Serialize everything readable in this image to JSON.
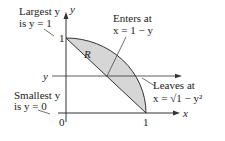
{
  "diagram": {
    "region_label": "R",
    "axes": {
      "x_label": "x",
      "y_label": "y",
      "origin_label": "0",
      "x_tick_label": "1",
      "y_tick_label": "1"
    },
    "horizontal_line_label": "y",
    "annotations": {
      "largest_line1": "Largest y",
      "largest_line2": "is y = 1",
      "smallest_line1": "Smallest y",
      "smallest_line2": "is y = 0",
      "enters_line1": "Enters at",
      "enters_line2": "x = 1 − y",
      "leaves_line1": "Leaves at",
      "leaves_line2": "x = √1 − y²"
    },
    "colors": {
      "region_fill": "#d6d6d6",
      "stroke": "#333333"
    }
  }
}
